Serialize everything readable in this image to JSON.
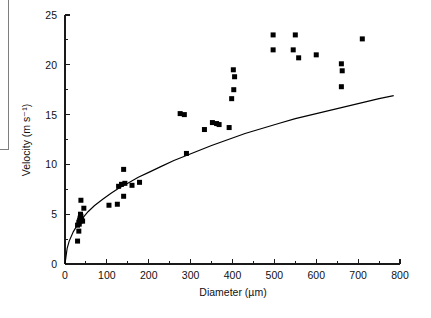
{
  "figure": {
    "background_color": "#ffffff",
    "marker_color": "#000000",
    "curve_color": "#000000",
    "axis_color": "#1a1a1a",
    "crop_box_color": "#7e7e7e"
  },
  "chart_data": {
    "type": "scatter",
    "title": "",
    "subtitle": "",
    "xlabel": "Diameter (µm)",
    "ylabel": "Velocity (m s⁻¹)",
    "xlim": [
      0,
      800
    ],
    "ylim": [
      0,
      25
    ],
    "xticks": [
      0,
      100,
      200,
      300,
      400,
      500,
      600,
      700,
      800
    ],
    "xtick_labels": [
      "0",
      "100",
      "200",
      "300",
      "400",
      "500",
      "600",
      "700",
      "800"
    ],
    "xminor_ticks": [
      50,
      150,
      250,
      350,
      450,
      550,
      650,
      750
    ],
    "yticks": [
      0,
      5,
      10,
      15,
      20,
      25
    ],
    "ytick_labels": [
      "0",
      "5",
      "10",
      "15",
      "20",
      "25"
    ],
    "yminor_ticks": [
      2.5,
      7.5,
      12.5,
      17.5,
      22.5
    ],
    "grid": false,
    "legend": null,
    "legend_position": "none",
    "marker": "square",
    "marker_size": 5,
    "series": [
      {
        "name": "Measured droplets",
        "type": "scatter",
        "points": [
          [
            30,
            2.3
          ],
          [
            33,
            3.3
          ],
          [
            30,
            3.9
          ],
          [
            34,
            4.0
          ],
          [
            33,
            4.2
          ],
          [
            36,
            4.3
          ],
          [
            35,
            4.4
          ],
          [
            38,
            4.5
          ],
          [
            36,
            4.6
          ],
          [
            40,
            4.4
          ],
          [
            42,
            4.3
          ],
          [
            38,
            4.8
          ],
          [
            37,
            5.0
          ],
          [
            45,
            5.6
          ],
          [
            38,
            6.4
          ],
          [
            105,
            5.9
          ],
          [
            125,
            6.0
          ],
          [
            140,
            6.8
          ],
          [
            128,
            7.8
          ],
          [
            135,
            8.0
          ],
          [
            143,
            8.1
          ],
          [
            160,
            7.9
          ],
          [
            178,
            8.2
          ],
          [
            140,
            9.5
          ],
          [
            290,
            11.1
          ],
          [
            275,
            15.1
          ],
          [
            285,
            15.0
          ],
          [
            333,
            13.5
          ],
          [
            352,
            14.2
          ],
          [
            362,
            14.1
          ],
          [
            368,
            14.0
          ],
          [
            392,
            13.7
          ],
          [
            398,
            16.6
          ],
          [
            403,
            17.5
          ],
          [
            405,
            18.8
          ],
          [
            402,
            19.5
          ],
          [
            497,
            21.5
          ],
          [
            497,
            23.0
          ],
          [
            545,
            21.5
          ],
          [
            550,
            23.0
          ],
          [
            558,
            20.7
          ],
          [
            600,
            21.0
          ],
          [
            660,
            17.8
          ],
          [
            662,
            19.4
          ],
          [
            660,
            20.1
          ],
          [
            710,
            22.6
          ]
        ]
      },
      {
        "name": "Fitted power-law curve",
        "type": "line",
        "equation_form": "v = a * d^b",
        "points": [
          [
            0,
            0
          ],
          [
            5,
            1.55
          ],
          [
            10,
            2.3
          ],
          [
            20,
            3.25
          ],
          [
            30,
            3.95
          ],
          [
            40,
            4.5
          ],
          [
            55,
            5.25
          ],
          [
            70,
            5.85
          ],
          [
            90,
            6.5
          ],
          [
            110,
            7.1
          ],
          [
            130,
            7.65
          ],
          [
            150,
            8.1
          ],
          [
            175,
            8.7
          ],
          [
            200,
            9.2
          ],
          [
            230,
            9.8
          ],
          [
            260,
            10.4
          ],
          [
            290,
            10.9
          ],
          [
            320,
            11.4
          ],
          [
            350,
            11.9
          ],
          [
            390,
            12.5
          ],
          [
            430,
            13.1
          ],
          [
            470,
            13.6
          ],
          [
            510,
            14.1
          ],
          [
            550,
            14.6
          ],
          [
            590,
            15.0
          ],
          [
            630,
            15.4
          ],
          [
            670,
            15.8
          ],
          [
            710,
            16.2
          ],
          [
            750,
            16.6
          ],
          [
            785,
            16.9
          ]
        ]
      }
    ]
  }
}
